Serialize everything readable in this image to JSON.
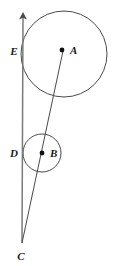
{
  "figure": {
    "background_color": "#ffffff",
    "stroke_color": "#4a4a4a",
    "label_color": "#1a1a1a",
    "width": 113,
    "height": 266
  },
  "labels": {
    "A": "A",
    "B": "B",
    "C": "C",
    "D": "D",
    "E": "E"
  },
  "points": [
    {
      "name": "A",
      "role": "center-large-circle",
      "x": 62,
      "y": 50,
      "label_x": 70,
      "label_y": 54,
      "dot": true
    },
    {
      "name": "B",
      "role": "center-small-circle",
      "x": 42,
      "y": 153,
      "label_x": 50,
      "label_y": 157,
      "dot": true
    },
    {
      "name": "C",
      "role": "intersection-of-lines",
      "x": 22,
      "y": 243,
      "label_x": 18,
      "label_y": 259,
      "dot": false
    },
    {
      "name": "D",
      "role": "tangent-point-small-circle",
      "x": 23,
      "y": 153,
      "label_x": 11,
      "label_y": 157,
      "dot": false
    },
    {
      "name": "E",
      "role": "tangent-point-large-circle",
      "x": 23,
      "y": 51,
      "label_x": 11,
      "label_y": 55,
      "dot": false
    }
  ],
  "circles": [
    {
      "name": "large-circle",
      "center": "A",
      "cx": 64,
      "cy": 54,
      "r": 43
    },
    {
      "name": "small-circle",
      "center": "B",
      "cx": 42,
      "cy": 153,
      "r": 19
    }
  ],
  "lines": [
    {
      "name": "tangent-ray",
      "from": "C",
      "through": [
        "D",
        "E"
      ],
      "x1": 22,
      "y1": 243,
      "x2": 23,
      "y2": 14,
      "arrow_at_top": true
    },
    {
      "name": "center-line",
      "from": "C",
      "through": [
        "B",
        "A"
      ],
      "x1": 22,
      "y1": 243,
      "x2": 63,
      "y2": 51,
      "arrow_at_top": false
    }
  ]
}
